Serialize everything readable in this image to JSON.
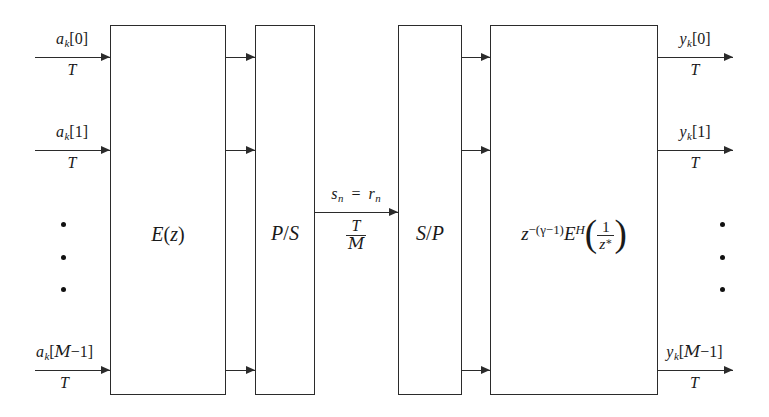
{
  "figure": {
    "type": "block-diagram",
    "background_color": "#ffffff",
    "line_color": "#2b2b2b"
  },
  "blocks": [
    {
      "id": "encoder",
      "label": "E(z)",
      "x": 110,
      "y": 25,
      "w": 116,
      "h": 370
    },
    {
      "id": "p2s",
      "label": "P/S",
      "x": 255,
      "y": 25,
      "w": 60,
      "h": 370
    },
    {
      "id": "s2p",
      "label": "S/P",
      "x": 398,
      "y": 25,
      "w": 64,
      "h": 370
    },
    {
      "id": "matched_filter",
      "label": "z^-(γ-1) E^H ( 1 / z* )",
      "x": 490,
      "y": 25,
      "w": 168,
      "h": 370
    }
  ],
  "inputs": {
    "rate_label": "T",
    "signals": [
      {
        "label": "a_k[0]",
        "y": 57
      },
      {
        "label": "a_k[1]",
        "y": 150
      },
      {
        "label": "a_k[M-1]",
        "y": 370
      }
    ]
  },
  "outputs": {
    "rate_label": "T",
    "signals": [
      {
        "label": "y_k[0]",
        "y": 57
      },
      {
        "label": "y_k[1]",
        "y": 150
      },
      {
        "label": "y_k[M-1]",
        "y": 370
      }
    ]
  },
  "channel": {
    "top_label": "s_n  =  r_n",
    "numerator": "T",
    "denominator": "M",
    "wire_y": 212,
    "x_start": 315,
    "x_end": 398
  },
  "internal_wires": {
    "encoder_to_p2s_x_start": 226,
    "encoder_to_p2s_x_end": 255,
    "s2p_to_mf_x_start": 462,
    "s2p_to_mf_x_end": 490,
    "ys": [
      57,
      150,
      370
    ]
  },
  "ellipsis": {
    "left": {
      "x": 63,
      "y_top": 222,
      "y_bottom": 292,
      "count": 3
    },
    "right": {
      "x": 722,
      "y_top": 222,
      "y_bottom": 292,
      "count": 3
    }
  },
  "symbols": {
    "script_m": "M",
    "gamma": "γ",
    "hermitian": "H",
    "conjugate": "*"
  }
}
